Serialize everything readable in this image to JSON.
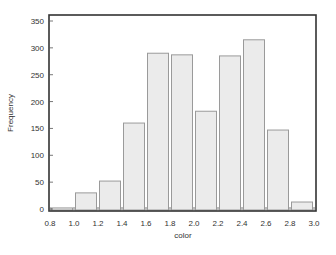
{
  "chart_data": {
    "type": "bar",
    "title": "",
    "xlabel": "color",
    "ylabel": "Frequency",
    "bin_edges": [
      0.8,
      1.0,
      1.2,
      1.4,
      1.6,
      1.8,
      2.0,
      2.2,
      2.4,
      2.6,
      2.8,
      3.0
    ],
    "categories": [
      "0.8-1.0",
      "1.0-1.2",
      "1.2-1.4",
      "1.4-1.6",
      "1.6-1.8",
      "1.8-2.0",
      "2.0-2.2",
      "2.2-2.4",
      "2.4-2.6",
      "2.6-2.8",
      "2.8-3.0"
    ],
    "values": [
      2,
      30,
      52,
      160,
      290,
      287,
      182,
      285,
      315,
      147,
      13
    ],
    "xlim": [
      0.8,
      3.0
    ],
    "ylim": [
      0,
      360
    ],
    "xticks": [
      "0.8",
      "1.0",
      "1.2",
      "1.4",
      "1.6",
      "1.8",
      "2.0",
      "2.2",
      "2.4",
      "2.6",
      "2.8",
      "3.0"
    ],
    "yticks": [
      "0",
      "50",
      "100",
      "150",
      "200",
      "250",
      "300",
      "350"
    ],
    "grid": false,
    "legend": null,
    "colors": {
      "bar_fill": "#ebebeb",
      "bar_stroke": "#9a9a9a",
      "frame": "#333333"
    }
  }
}
